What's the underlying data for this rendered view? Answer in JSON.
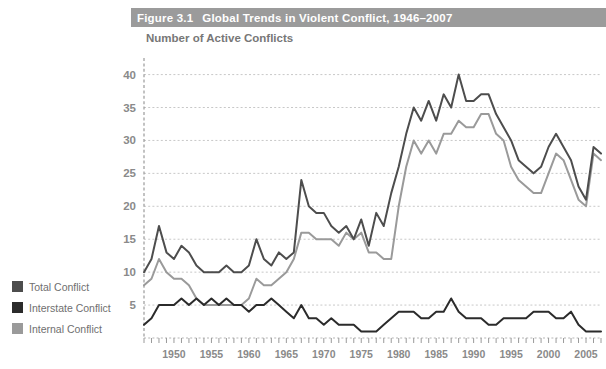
{
  "figure": {
    "number": "Figure 3.1",
    "title": "Global Trends in Violent Conflict, 1946–2007",
    "title_bar_color": "#9b9b9b",
    "title_text_color": "#ffffff"
  },
  "legend": {
    "position": "left-outside",
    "items": [
      {
        "label": "Total Conflict",
        "color": "#4d4d4d"
      },
      {
        "label": "Interstate Conflict",
        "color": "#2b2b2b"
      },
      {
        "label": "Internal Conflict",
        "color": "#9a9a9a"
      }
    ]
  },
  "axes": {
    "y_title": "Number of Active Conflicts",
    "y_ticks": [
      5,
      10,
      15,
      20,
      25,
      30,
      35,
      40
    ],
    "y_tick_labels": [
      "5",
      "10",
      "15",
      "20",
      "25",
      "30",
      "35",
      "40"
    ],
    "ylim": [
      0,
      41
    ],
    "x_tick_labels": [
      "1950",
      "1955",
      "1960",
      "1965",
      "1970",
      "1975",
      "1980",
      "1985",
      "1990",
      "1995",
      "2000",
      "2005"
    ],
    "x_ticks": [
      1950,
      1955,
      1960,
      1965,
      1970,
      1975,
      1980,
      1985,
      1990,
      1995,
      2000,
      2005
    ],
    "xlim": [
      1946,
      2007
    ],
    "grid": "horizontal-dotted",
    "grid_color": "#c8c8c8",
    "tick_color": "#8a8a8a"
  },
  "chart_data": {
    "type": "line",
    "title": "Global Trends in Violent Conflict, 1946–2007",
    "xlabel": "",
    "ylabel": "Number of Active Conflicts",
    "xlim": [
      1946,
      2007
    ],
    "ylim": [
      0,
      41
    ],
    "grid": true,
    "legend_position": "left-outside",
    "x": [
      1946,
      1947,
      1948,
      1949,
      1950,
      1951,
      1952,
      1953,
      1954,
      1955,
      1956,
      1957,
      1958,
      1959,
      1960,
      1961,
      1962,
      1963,
      1964,
      1965,
      1966,
      1967,
      1968,
      1969,
      1970,
      1971,
      1972,
      1973,
      1974,
      1975,
      1976,
      1977,
      1978,
      1979,
      1980,
      1981,
      1982,
      1983,
      1984,
      1985,
      1986,
      1987,
      1988,
      1989,
      1990,
      1991,
      1992,
      1993,
      1994,
      1995,
      1996,
      1997,
      1998,
      1999,
      2000,
      2001,
      2002,
      2003,
      2004,
      2005,
      2006,
      2007
    ],
    "series": [
      {
        "name": "Total Conflict",
        "color": "#4d4d4d",
        "values": [
          10,
          12,
          17,
          13,
          12,
          14,
          13,
          11,
          10,
          10,
          10,
          11,
          10,
          10,
          11,
          15,
          12,
          11,
          13,
          12,
          13,
          24,
          20,
          19,
          19,
          17,
          16,
          17,
          15,
          18,
          14,
          19,
          17,
          22,
          26,
          31,
          35,
          33,
          36,
          33,
          37,
          35,
          40,
          36,
          36,
          37,
          37,
          34,
          32,
          30,
          27,
          26,
          25,
          26,
          29,
          31,
          29,
          27,
          23,
          21,
          29,
          28
        ]
      },
      {
        "name": "Interstate Conflict",
        "color": "#2b2b2b",
        "values": [
          2,
          3,
          5,
          5,
          5,
          6,
          5,
          6,
          5,
          6,
          5,
          6,
          5,
          5,
          4,
          5,
          5,
          6,
          5,
          4,
          3,
          5,
          3,
          3,
          2,
          3,
          2,
          2,
          2,
          1,
          1,
          1,
          2,
          3,
          4,
          4,
          4,
          3,
          3,
          4,
          4,
          6,
          4,
          3,
          3,
          3,
          2,
          2,
          3,
          3,
          3,
          3,
          4,
          4,
          4,
          3,
          3,
          4,
          2,
          1,
          1,
          1
        ]
      },
      {
        "name": "Internal Conflict",
        "color": "#9a9a9a",
        "values": [
          8,
          9,
          12,
          10,
          9,
          9,
          8,
          6,
          5,
          5,
          5,
          5,
          5,
          5,
          6,
          9,
          8,
          8,
          9,
          10,
          12,
          16,
          16,
          15,
          15,
          15,
          14,
          16,
          15,
          16,
          13,
          13,
          12,
          12,
          20,
          26,
          30,
          28,
          30,
          28,
          31,
          31,
          33,
          32,
          32,
          34,
          34,
          31,
          30,
          26,
          24,
          23,
          22,
          22,
          25,
          28,
          27,
          24,
          21,
          20,
          28,
          27
        ]
      }
    ]
  }
}
